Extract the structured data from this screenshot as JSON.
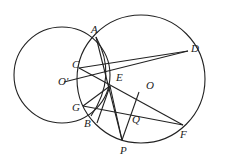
{
  "diagram": {
    "type": "geometry",
    "stroke_color": "#222222",
    "points": {
      "A": {
        "label": "A",
        "x": 96,
        "y": 37
      },
      "B": {
        "label": "B",
        "x": 91,
        "y": 116
      },
      "C": {
        "label": "C",
        "x": 79,
        "y": 68
      },
      "D": {
        "label": "D",
        "x": 188,
        "y": 51
      },
      "E": {
        "label": "E",
        "x": 110,
        "y": 86
      },
      "F": {
        "label": "F",
        "x": 183,
        "y": 125
      },
      "G": {
        "label": "G",
        "x": 83,
        "y": 106
      },
      "O": {
        "label": "O",
        "x": 139,
        "y": 93
      },
      "O_prime": {
        "label": "O'",
        "x": 62,
        "y": 78
      },
      "P": {
        "label": "P",
        "x": 122,
        "y": 140
      },
      "Q": {
        "label": "Q",
        "x": 131,
        "y": 113
      }
    },
    "circles": [
      {
        "name": "circle-O-prime",
        "cx": 62,
        "cy": 75,
        "r": 48
      },
      {
        "name": "circle-O",
        "cx": 140,
        "cy": 80,
        "r": 63
      }
    ],
    "segments": [
      [
        "C",
        "D"
      ],
      [
        "O_prime",
        "D"
      ],
      [
        "C",
        "F"
      ],
      [
        "G",
        "F"
      ],
      [
        "G",
        "D"
      ],
      [
        "A",
        "P"
      ],
      [
        "E",
        "P"
      ],
      [
        "O",
        "P"
      ],
      [
        "A",
        "B"
      ]
    ]
  }
}
